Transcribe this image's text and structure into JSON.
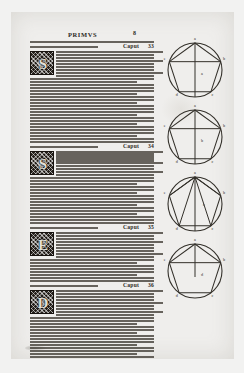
{
  "document": {
    "running_head": "PRIMVS",
    "folio": "8",
    "language": "Latin",
    "page_kind": "incunabulum geometry treatise page"
  },
  "column": {
    "paragraphs": [
      {
        "id": "para-1",
        "initial": "S",
        "caput_label": "Caput",
        "caput_number": "33",
        "lines_before": 1,
        "lines_beside_initial": 9,
        "lines_after": 22
      },
      {
        "id": "para-2",
        "initial": "S",
        "caput_label": "Caput",
        "caput_number": "34",
        "lines_before": 0,
        "lines_beside_initial": 9,
        "lines_after": 16
      },
      {
        "id": "para-3",
        "initial": "E",
        "caput_label": "Caput",
        "caput_number": "35",
        "lines_before": 0,
        "lines_beside_initial": 9,
        "lines_after": 8
      },
      {
        "id": "para-4",
        "initial": "D",
        "caput_label": "Caput",
        "caput_number": "36",
        "lines_before": 0,
        "lines_beside_initial": 9,
        "lines_after": 14
      }
    ]
  },
  "figures": [
    {
      "id": "figure-1",
      "caption_letter": "a",
      "description": "circle with inscribed pentagon, vertical diameter and horizontal chord",
      "vertex_labels": [
        "a",
        "b",
        "c",
        "d",
        "e"
      ],
      "center_label": "a",
      "has_vertical_axis": true,
      "has_horizontal_chord": true,
      "has_apex_fan": false
    },
    {
      "id": "figure-2",
      "caption_letter": "b",
      "description": "circle with inscribed pentagon, vertical diameter and horizontal chord",
      "vertex_labels": [
        "a",
        "b",
        "c",
        "d",
        "e"
      ],
      "center_label": "b",
      "has_vertical_axis": true,
      "has_horizontal_chord": true,
      "has_apex_fan": false
    },
    {
      "id": "figure-3",
      "caption_letter": "c",
      "description": "circle with inscribed pentagon triangulated by chords radiating from the apex",
      "vertex_labels": [
        "a",
        "b",
        "c",
        "d",
        "e"
      ],
      "center_label": "c",
      "has_vertical_axis": true,
      "has_horizontal_chord": false,
      "has_apex_fan": true
    },
    {
      "id": "figure-4",
      "caption_letter": "d",
      "description": "circle with inscribed pentagon, upper triangle and short vertical segment",
      "vertex_labels": [
        "a",
        "b",
        "c",
        "d",
        "e"
      ],
      "center_label": "d",
      "has_vertical_axis": true,
      "has_horizontal_chord": true,
      "has_apex_fan": false
    }
  ],
  "colors": {
    "paper": "#efeeec",
    "scan_background": "#f2f2f1",
    "ink": "#403c35",
    "initial_block": "#241f1a"
  }
}
